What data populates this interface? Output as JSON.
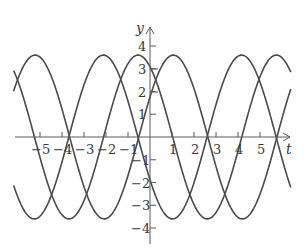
{
  "chart_data": {
    "type": "line",
    "title": "",
    "xlabel": "t",
    "ylabel": "y",
    "xlim": [
      -6.8,
      6.6
    ],
    "ylim": [
      -4.7,
      4.6
    ],
    "grid": false,
    "legend": "none",
    "x_ticks": [
      -5,
      -4,
      -3,
      -2,
      -1,
      1,
      2,
      3,
      4,
      5
    ],
    "x_tick_labels": [
      "−5",
      "−4",
      "−3",
      "−2",
      "−1",
      "1",
      "2",
      "3",
      "4",
      "5"
    ],
    "y_ticks": [
      -4,
      -3,
      -2,
      -1,
      1,
      2,
      3,
      4
    ],
    "y_tick_labels": [
      "−4",
      "−3",
      "−2",
      "−1",
      "1",
      "2",
      "3",
      "4"
    ],
    "series": [
      {
        "name": "curve-a",
        "form": "y = A cos(t - phase)",
        "amplitude": 3.6,
        "phase": 1.06,
        "t_range": [
          -6.2,
          6.4
        ]
      },
      {
        "name": "curve-b",
        "form": "y = A cos(t - phase)",
        "amplitude": 3.6,
        "phase": -2.12,
        "t_range": [
          -6.2,
          6.4
        ]
      },
      {
        "name": "curve-c",
        "form": "y = A cos(t - phase)",
        "amplitude": 3.6,
        "phase": -0.54,
        "t_range": [
          -6.2,
          6.4
        ]
      }
    ],
    "annotations": [
      {
        "type": "horizontal-mark",
        "y": 3,
        "near_t": 0.25
      },
      {
        "type": "horizontal-mark",
        "y": 2,
        "near_t": 0.25
      }
    ]
  },
  "axes": {
    "x_label": "t",
    "y_label": "y"
  },
  "style": {
    "line_color": "#4a4a4a",
    "axis_color": "#5a5a5a",
    "text_color": "#3a3a3a"
  }
}
